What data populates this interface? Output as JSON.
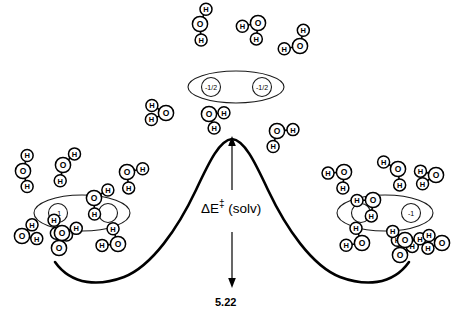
{
  "figure": {
    "barrier_label_main": "ΔE",
    "barrier_label_sup": "‡",
    "barrier_label_tail": " (solv)",
    "barrier_value": "5.22",
    "stroke_color": "#000000",
    "background_color": "#ffffff"
  },
  "chart_data": {
    "type": "line",
    "xlabel": "Reaction coordinate",
    "ylabel": "Energy",
    "grid": false,
    "legend": null,
    "annotations": [
      {
        "text": "ΔE‡ (solv)",
        "role": "activation-barrier-label"
      },
      {
        "text": "5.22",
        "role": "activation-barrier-value"
      }
    ],
    "curve_description": "Double-well energy profile: reactant valley on the left, transition-state maximum at center, product valley on the right",
    "x": [
      0,
      1,
      2,
      3,
      4
    ],
    "y": [
      0.62,
      0.0,
      1.0,
      0.0,
      0.62
    ],
    "stationary_points": [
      {
        "name": "reactants",
        "x": 1,
        "y": 0.0
      },
      {
        "name": "transition-state",
        "x": 2,
        "y": 1.0
      },
      {
        "name": "products",
        "x": 3,
        "y": 0.0
      }
    ]
  },
  "species": {
    "reactant_complex": {
      "name": "reactant-complex",
      "charges": [
        "-1",
        ""
      ],
      "charge_left": "-1",
      "charge_right": ""
    },
    "transition_state": {
      "name": "transition-state-complex",
      "charges": [
        "-1/2",
        "-1/2"
      ],
      "charge_left": "-1/2",
      "charge_right": "-1/2"
    },
    "product_complex": {
      "name": "product-complex",
      "charges": [
        "",
        "-1"
      ],
      "charge_left": "",
      "charge_right": "-1"
    }
  },
  "atoms": {
    "oxygen_label": "O",
    "hydrogen_label": "H"
  },
  "water_molecules": {
    "count_total": 27,
    "top_cluster_count": 5,
    "left_cluster_count": 8,
    "right_cluster_count": 8,
    "description": "Explicit water molecules, each drawn as one large O circle bonded to two smaller H circles"
  }
}
